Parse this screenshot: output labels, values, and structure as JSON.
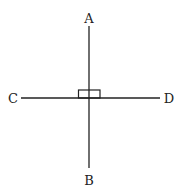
{
  "diagram": {
    "labels": {
      "top": "A",
      "bottom": "B",
      "left": "C",
      "right": "D"
    },
    "stroke_color": "#222222",
    "background": "#ffffff"
  }
}
